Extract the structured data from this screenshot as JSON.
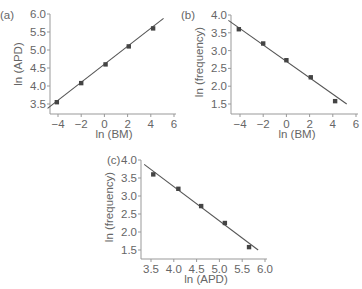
{
  "chart_data": [
    {
      "id": "a",
      "panel_label": "(a)",
      "type": "scatter",
      "title": "",
      "xlabel": "ln (BM)",
      "ylabel": "ln (APD)",
      "xlim": [
        -5,
        6
      ],
      "ylim": [
        3.3,
        6.0
      ],
      "xticks": [
        -4,
        -2,
        0,
        2,
        4,
        6
      ],
      "xtick_labels": [
        "−4",
        "−2",
        "0",
        "2",
        "4",
        "6"
      ],
      "yticks": [
        3.5,
        4.0,
        4.5,
        5.0,
        5.5,
        6.0
      ],
      "ytick_labels": [
        "3.5",
        "4.0",
        "4.5",
        "5.0",
        "5.5",
        "6.0"
      ],
      "grid": false,
      "points": [
        [
          -4.1,
          3.55
        ],
        [
          -2.0,
          4.08
        ],
        [
          0.1,
          4.6
        ],
        [
          2.1,
          5.1
        ],
        [
          4.2,
          5.6
        ]
      ],
      "fit_line": [
        [
          -4.9,
          3.38
        ],
        [
          5.1,
          5.88
        ]
      ],
      "box": {
        "x0": 50,
        "y0": 14,
        "x1": 174,
        "y1": 114,
        "xmin_px": 58,
        "xmax_px": 174
      }
    },
    {
      "id": "b",
      "panel_label": "(b)",
      "type": "scatter",
      "title": "",
      "xlabel": "ln (BM)",
      "ylabel": "ln (frequency)",
      "xlim": [
        -5,
        6
      ],
      "ylim": [
        1.2,
        4.0
      ],
      "xticks": [
        -4,
        -2,
        0,
        2,
        4,
        6
      ],
      "xtick_labels": [
        "−4",
        "−2",
        "0",
        "2",
        "4",
        "6"
      ],
      "yticks": [
        1.5,
        2.0,
        2.5,
        3.0,
        3.5,
        4.0
      ],
      "ytick_labels": [
        "1.5",
        "2.0",
        "2.5",
        "3.0",
        "3.5",
        "4.0"
      ],
      "grid": false,
      "points": [
        [
          -4.1,
          3.6
        ],
        [
          -2.0,
          3.2
        ],
        [
          0.0,
          2.73
        ],
        [
          2.1,
          2.25
        ],
        [
          4.2,
          1.58
        ]
      ],
      "fit_line": [
        [
          -5.0,
          3.85
        ],
        [
          5.2,
          1.5
        ]
      ],
      "box": {
        "x0": 231,
        "y0": 15,
        "x1": 356,
        "y1": 114
      }
    },
    {
      "id": "c",
      "panel_label": "(c)",
      "type": "scatter",
      "title": "",
      "xlabel": "ln (APD)",
      "ylabel": "ln (frequency)",
      "xlim": [
        3.3,
        6.0
      ],
      "ylim": [
        1.2,
        4.0
      ],
      "xticks": [
        3.5,
        4.0,
        4.5,
        5.0,
        5.5,
        6.0
      ],
      "xtick_labels": [
        "3.5",
        "4.0",
        "4.5",
        "5.0",
        "5.5",
        "6.0"
      ],
      "yticks": [
        1.5,
        2.0,
        2.5,
        3.0,
        3.5,
        4.0
      ],
      "ytick_labels": [
        "1.5",
        "2.0",
        "2.5",
        "3.0",
        "3.5",
        "4.0"
      ],
      "grid": false,
      "points": [
        [
          3.55,
          3.6
        ],
        [
          4.1,
          3.2
        ],
        [
          4.6,
          2.72
        ],
        [
          5.12,
          2.25
        ],
        [
          5.65,
          1.58
        ]
      ],
      "fit_line": [
        [
          3.35,
          3.88
        ],
        [
          5.85,
          1.5
        ]
      ],
      "box": {
        "x0": 141,
        "y0": 160,
        "x1": 265,
        "y1": 259
      }
    }
  ]
}
